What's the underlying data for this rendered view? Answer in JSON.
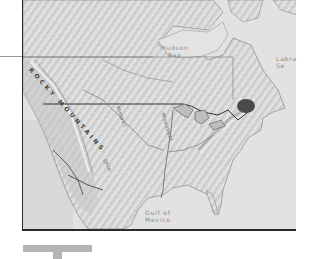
{
  "map": {
    "title": "North America shaded relief",
    "labels": {
      "hudson_bay": "Hudson\nBay",
      "labrador_sea": "Labra\nSe",
      "gulf_of_mexico": "Gulf of\nMexico",
      "rocky_mountains": "ROCKY MOUNTAINS",
      "missouri": "Missouri",
      "mississippi": "Mississippi",
      "ohio": "Ohio"
    },
    "colors": {
      "land": "#d9d9d9",
      "ocean": "#e4e4e4",
      "border": "#2a2a2a",
      "highlight_region": "#4a4a4a",
      "legend_bar": "#b4b4b4"
    },
    "highlighted_region": "Quebec lake area (dark marker)"
  }
}
